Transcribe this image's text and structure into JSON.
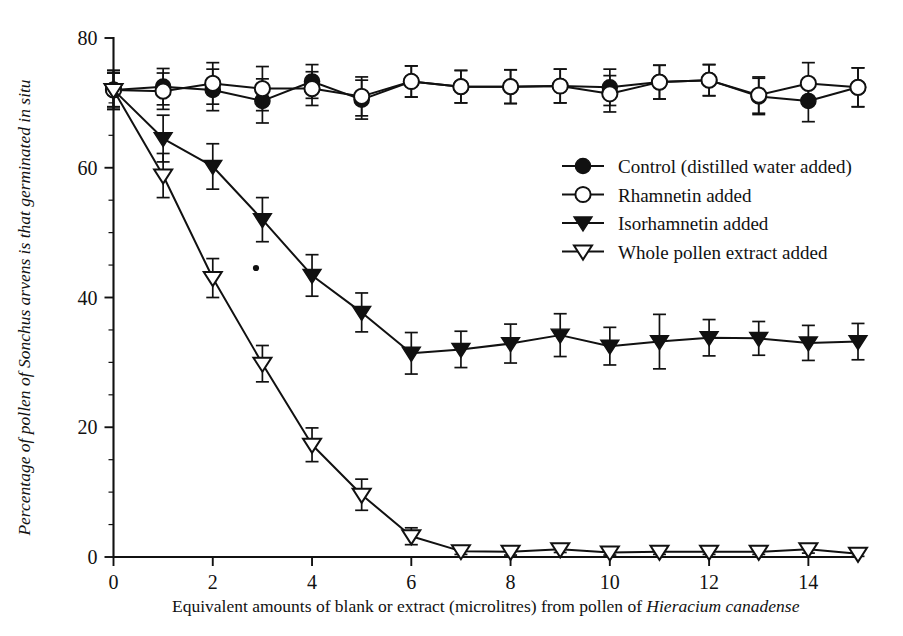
{
  "chart_data": {
    "type": "line",
    "title": "",
    "xlabel_parts": [
      {
        "text": "Equivalent amounts of blank or extract (microlitres) from pollen of ",
        "italic": false
      },
      {
        "text": "Hieracium canadense",
        "italic": true
      }
    ],
    "xlabel": "Equivalent amounts of blank or extract (microlitres) from pollen of Hieracium canadense",
    "ylabel": "Percentage of pollen of Sonchus arvens is that germinated in situ",
    "x": [
      0,
      1,
      2,
      3,
      4,
      5,
      6,
      7,
      8,
      9,
      10,
      11,
      12,
      13,
      14,
      15
    ],
    "xlim": [
      0,
      15
    ],
    "ylim": [
      0,
      80
    ],
    "xticks": [
      0,
      2,
      4,
      6,
      8,
      10,
      12,
      14
    ],
    "xtick_labels": [
      "0",
      "2",
      "4",
      "6",
      "8",
      "10",
      "12",
      "14"
    ],
    "yticks": [
      0,
      20,
      40,
      60,
      80
    ],
    "ytick_labels": [
      "0",
      "20",
      "40",
      "60",
      "80"
    ],
    "grid": false,
    "legend_position": "upper-right-inside",
    "error_bars": "standard error",
    "series": [
      {
        "name": "Control (distilled water added)",
        "marker": "filled-circle",
        "values": [
          72.0,
          72.5,
          72.0,
          70.3,
          73.3,
          70.5,
          73.3,
          72.5,
          72.5,
          72.6,
          72.4,
          73.2,
          73.5,
          71.0,
          70.3,
          72.4
        ],
        "errors": [
          3.0,
          2.8,
          3.2,
          3.4,
          2.6,
          3.0,
          2.4,
          2.5,
          2.6,
          2.6,
          2.8,
          2.6,
          2.4,
          2.8,
          3.2,
          3.0
        ]
      },
      {
        "name": "Rhamnetin added",
        "marker": "open-circle",
        "values": [
          72.0,
          71.8,
          73.0,
          72.2,
          72.2,
          71.0,
          73.3,
          72.5,
          72.5,
          72.6,
          71.4,
          73.2,
          73.5,
          71.2,
          73.0,
          72.4
        ],
        "errors": [
          3.0,
          2.8,
          3.2,
          3.4,
          2.6,
          3.0,
          2.4,
          2.5,
          2.6,
          2.6,
          2.8,
          2.6,
          2.4,
          2.8,
          3.2,
          3.0
        ]
      },
      {
        "name": "Isorhamnetin added",
        "marker": "filled-triangle-down",
        "values": [
          72.0,
          64.5,
          60.2,
          52.0,
          43.4,
          37.7,
          31.4,
          32.0,
          32.9,
          34.2,
          32.5,
          33.2,
          33.8,
          33.7,
          33.0,
          33.2
        ],
        "errors": [
          2.6,
          3.6,
          3.5,
          3.4,
          3.2,
          3.0,
          3.2,
          2.8,
          3.0,
          3.3,
          2.9,
          4.2,
          2.8,
          2.6,
          2.7,
          2.8
        ]
      },
      {
        "name": "Whole pollen extract added",
        "marker": "open-triangle-down",
        "values": [
          72.0,
          58.8,
          43.0,
          29.8,
          17.3,
          9.6,
          3.2,
          0.9,
          0.8,
          1.2,
          0.7,
          0.8,
          0.8,
          0.8,
          1.2,
          0.5
        ],
        "errors": [
          2.6,
          3.4,
          3.0,
          2.8,
          2.6,
          2.4,
          1.3,
          0.5,
          0.5,
          0.5,
          0.4,
          0.4,
          0.4,
          0.4,
          0.6,
          0.4
        ]
      }
    ]
  },
  "legend": {
    "items": [
      {
        "label": "Control (distilled water added)",
        "marker": "filled-circle"
      },
      {
        "label": "Rhamnetin added",
        "marker": "open-circle"
      },
      {
        "label": "Isorhamnetin added",
        "marker": "filled-triangle-down"
      },
      {
        "label": "Whole pollen extract added",
        "marker": "open-triangle-down"
      }
    ]
  },
  "colors": {
    "ink": "#111111",
    "paper": "#ffffff"
  }
}
